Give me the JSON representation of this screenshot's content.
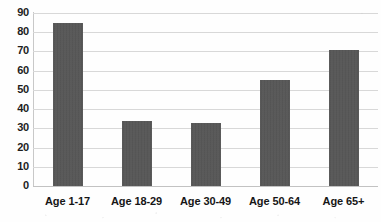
{
  "chart_data": {
    "type": "bar",
    "title": "",
    "xlabel": "",
    "ylabel": "",
    "categories": [
      "Age 1-17",
      "Age 18-29",
      "Age 30-49",
      "Age 50-64",
      "Age 65+"
    ],
    "values": [
      85,
      34,
      33,
      55,
      71
    ],
    "ylim": [
      0,
      90
    ],
    "ytick_labels": [
      "90",
      "80",
      "70",
      "60",
      "50",
      "40",
      "30",
      "20",
      "10",
      "0"
    ],
    "ytick_values": [
      90,
      80,
      70,
      60,
      50,
      40,
      30,
      20,
      10,
      0
    ],
    "ytick_step": 10,
    "grid": true,
    "grid_axis": "y",
    "legend": false,
    "legend_position": "none",
    "series": [
      {
        "name": "",
        "values": [
          85,
          34,
          33,
          55,
          71
        ],
        "color": "#565656"
      }
    ],
    "colors": {
      "bar": "#565656",
      "gridline": "#d8d8d8",
      "axis": "#c8c8c8",
      "text": "#1d1d1d",
      "background": "#ffffff"
    }
  }
}
